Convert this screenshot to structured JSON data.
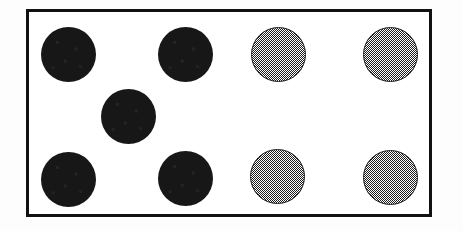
{
  "figure": {
    "canvas_width": 463,
    "canvas_height": 231,
    "background_color": "#fdfdfd"
  },
  "frame": {
    "label": "scene frame",
    "x": 26,
    "y": 9,
    "width": 406,
    "height": 208,
    "border_width": 3,
    "border_color": "#111111",
    "fill_color": "#ffffff"
  },
  "palette": {
    "dark_fill": "#171717",
    "dither_fill": "#999999",
    "dither_outline": "#1a1a1a",
    "frame_color": "#111111",
    "paper": "#ffffff"
  },
  "chart_data": {
    "type": "scatter",
    "xlabel": "",
    "ylabel": "",
    "xlim": [
      26,
      432
    ],
    "ylim": [
      9,
      217
    ],
    "grid": false,
    "legend": "none",
    "marker_shape": "circle",
    "marker_diameter": 55,
    "categories": [
      "dark",
      "dither-gray"
    ],
    "counts": {
      "dark": 5,
      "dither-gray": 4,
      "total": 9
    },
    "rows": [
      {
        "name": "top-row",
        "center_y": 54,
        "tokens": [
          {
            "id": "t1",
            "fill": "dark",
            "center_x": 68,
            "center_y": 54,
            "diameter": 55
          },
          {
            "id": "t2",
            "fill": "dark",
            "center_x": 185,
            "center_y": 54,
            "diameter": 55
          },
          {
            "id": "t3",
            "fill": "dither-gray",
            "center_x": 278,
            "center_y": 54,
            "diameter": 55
          },
          {
            "id": "t4",
            "fill": "dither-gray",
            "center_x": 390,
            "center_y": 54,
            "diameter": 55
          }
        ]
      },
      {
        "name": "middle-row",
        "center_y": 116,
        "tokens": [
          {
            "id": "m1",
            "fill": "dark",
            "center_x": 128,
            "center_y": 116,
            "diameter": 55
          }
        ]
      },
      {
        "name": "bottom-row",
        "center_y": 178,
        "tokens": [
          {
            "id": "b1",
            "fill": "dark",
            "center_x": 68,
            "center_y": 179,
            "diameter": 55
          },
          {
            "id": "b2",
            "fill": "dark",
            "center_x": 185,
            "center_y": 178,
            "diameter": 55
          },
          {
            "id": "b3",
            "fill": "dither-gray",
            "center_x": 277,
            "center_y": 176,
            "diameter": 55
          },
          {
            "id": "b4",
            "fill": "dither-gray",
            "center_x": 390,
            "center_y": 177,
            "diameter": 55
          }
        ]
      }
    ]
  }
}
